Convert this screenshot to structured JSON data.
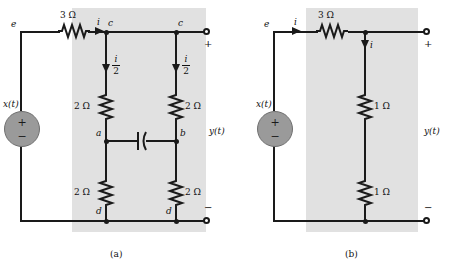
{
  "figure": {
    "caption_a": "(a)",
    "caption_b": "(b)"
  },
  "circuit_a": {
    "source_label": "x(t)",
    "source_plus": "+",
    "source_minus": "−",
    "node_e": "e",
    "current_i": "i",
    "node_c_left": "c",
    "node_c_right": "c",
    "node_a": "a",
    "node_b": "b",
    "node_d_left": "d",
    "node_d_right": "d",
    "series_resistor": "3 Ω",
    "r_top_left": "2 Ω",
    "r_top_right": "2 Ω",
    "r_bot_left": "2 Ω",
    "r_bot_right": "2 Ω",
    "branch_current_left_num": "i",
    "branch_current_left_den": "2",
    "branch_current_right_num": "i",
    "branch_current_right_den": "2",
    "output_label": "y(t)",
    "output_plus": "+",
    "output_minus": "−",
    "capacitor": "capacitor"
  },
  "circuit_b": {
    "source_label": "x(t)",
    "source_plus": "+",
    "source_minus": "−",
    "node_e": "e",
    "current_i": "i",
    "branch_current": "i",
    "series_resistor": "3 Ω",
    "r_upper": "1 Ω",
    "r_lower": "1 Ω",
    "output_label": "y(t)",
    "output_plus": "+",
    "output_minus": "−"
  },
  "colors": {
    "wire": "#1a1a1a",
    "shade": "#c9c9c9",
    "source_fill": "#9a9a9a",
    "text": "#111111"
  }
}
